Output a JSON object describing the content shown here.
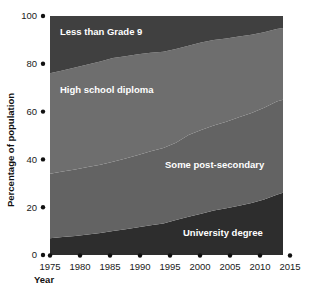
{
  "chart_data": {
    "type": "area",
    "stacked": true,
    "title": "",
    "subtitle": "",
    "xlabel": "Year",
    "ylabel": "Percentage of population",
    "xlim": [
      1975,
      2015
    ],
    "ylim": [
      0,
      100
    ],
    "grid": false,
    "legend_position": "inline-labels",
    "x_tick_labels": [
      "1975",
      "1980",
      "1985",
      "1990",
      "1995",
      "2000",
      "2005",
      "2010",
      "2015"
    ],
    "x_ticks": [
      1975,
      1980,
      1985,
      1990,
      1995,
      2000,
      2005,
      2010,
      2015
    ],
    "y_tick_labels": [
      "0",
      "20",
      "40",
      "60",
      "80",
      "100"
    ],
    "y_ticks": [
      0,
      20,
      40,
      60,
      80,
      100
    ],
    "data_x_start": 1975,
    "data_x_end": 2012,
    "x": [
      1975,
      1977,
      1979,
      1981,
      1983,
      1985,
      1987,
      1989,
      1991,
      1993,
      1995,
      1997,
      1999,
      2001,
      2003,
      2005,
      2007,
      2009,
      2011,
      2012
    ],
    "series": [
      {
        "name": "University degree",
        "color": "#2d2d2d",
        "label": "University degree",
        "values": [
          7,
          7.5,
          8,
          8.6,
          9.2,
          10,
          10.8,
          11.6,
          12.4,
          13.2,
          14.6,
          16,
          17.3,
          18.6,
          19.6,
          20.6,
          21.8,
          23.2,
          25.2,
          26
        ]
      },
      {
        "name": "Some post-secondary",
        "color": "#636363",
        "label": "Some post-secondary",
        "values": [
          27,
          27.4,
          27.8,
          28.2,
          28.6,
          29,
          29.6,
          30.2,
          31,
          31.6,
          32.4,
          34.2,
          35,
          35.6,
          36.2,
          37,
          37.6,
          38.4,
          39,
          39
        ]
      },
      {
        "name": "High school diploma",
        "color": "#6e6e6e",
        "label": "High school diploma",
        "values": [
          42,
          42.3,
          42.6,
          42.9,
          43.2,
          43.4,
          42.8,
          42.2,
          41.2,
          40.2,
          39.2,
          37.4,
          36.6,
          35.8,
          34.8,
          33.8,
          32.8,
          31.6,
          30.4,
          30
        ]
      },
      {
        "name": "Less than Grade 9",
        "color": "#404040",
        "label": "Less than Grade 9",
        "values": [
          24,
          22.8,
          21.6,
          20.3,
          19,
          17.6,
          16.8,
          16,
          15.4,
          15,
          13.8,
          12.4,
          11.1,
          10,
          9.4,
          8.6,
          7.8,
          6.8,
          5.4,
          5
        ]
      }
    ],
    "series_label_positions": [
      {
        "name": "Less than Grade 9",
        "x": 60,
        "y": 35
      },
      {
        "name": "High school diploma",
        "x": 60,
        "y": 93
      },
      {
        "name": "Some post-secondary",
        "x": 165,
        "y": 168
      },
      {
        "name": "University degree",
        "x": 183,
        "y": 236
      }
    ]
  },
  "axes": {
    "y_axis_title": "Percentage of population",
    "x_axis_title": "Year"
  },
  "colors": {
    "background": "#ffffff",
    "text": "#111111",
    "label_text": "#ffffff"
  }
}
